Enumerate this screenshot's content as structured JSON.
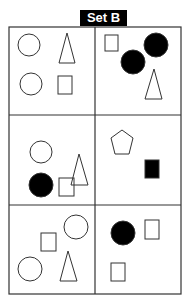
{
  "title": "Set B",
  "colors": {
    "line": "#333333",
    "fill": "#000000",
    "background": "#ffffff"
  },
  "grid": {
    "rows": 3,
    "cols": 2
  },
  "cells": [
    {
      "row": 1,
      "col": 1,
      "shapes": [
        "circle-outline",
        "triangle-outline",
        "circle-outline",
        "square-outline"
      ]
    },
    {
      "row": 1,
      "col": 2,
      "shapes": [
        "square-outline",
        "circle-filled",
        "circle-filled",
        "triangle-outline"
      ]
    },
    {
      "row": 2,
      "col": 1,
      "shapes": [
        "circle-outline",
        "circle-filled",
        "square-outline",
        "triangle-outline"
      ]
    },
    {
      "row": 2,
      "col": 2,
      "shapes": [
        "pentagon-outline",
        "square-filled"
      ]
    },
    {
      "row": 3,
      "col": 1,
      "shapes": [
        "circle-outline",
        "square-outline",
        "circle-outline",
        "triangle-outline"
      ]
    },
    {
      "row": 3,
      "col": 2,
      "shapes": [
        "circle-filled",
        "square-outline",
        "square-outline"
      ]
    }
  ]
}
